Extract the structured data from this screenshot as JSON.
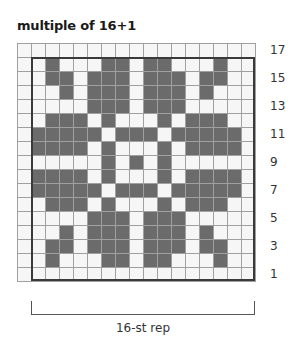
{
  "chart": {
    "title": "multiple of 16+1",
    "columns": 17,
    "rows": 17,
    "colors": {
      "dark": "#6b6b6b",
      "light": "#f6f6f6",
      "gridline": "#a0a0a0",
      "repeat_border": "#3a3a3a"
    },
    "row_labels": [
      "17",
      "15",
      "13",
      "11",
      "9",
      "7",
      "5",
      "3",
      "1"
    ],
    "repeat_label": "16-st rep",
    "repeat_box": {
      "first_col": 2,
      "last_col": 17,
      "first_row": 1,
      "last_row": 16
    },
    "grid_top_to_bottom": [
      "00000000000000000",
      "00100011011000100",
      "00110111011101100",
      "00010111011101000",
      "00000111011100000",
      "00111010001011100",
      "01111101110111110",
      "01111010001011110",
      "00000010101000000",
      "01111010001011110",
      "01111101110111110",
      "00111010001011100",
      "00000111011100000",
      "00010111011101000",
      "00110111011101100",
      "00100011011000100",
      "00000000000000000"
    ]
  }
}
